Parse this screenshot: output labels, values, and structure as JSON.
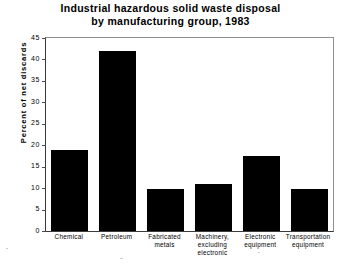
{
  "chart_data": {
    "type": "bar",
    "title": "Industrial hazardous solid waste disposal by manufacturing group, 1983",
    "title_lines": [
      "Industrial hazardous solid waste disposal",
      "by manufacturing group, 1983"
    ],
    "xlabel": "",
    "ylabel": "Percent of net discards",
    "ylim": [
      0,
      45
    ],
    "ytick_step": 5,
    "yticks": [
      0,
      5,
      10,
      15,
      20,
      25,
      30,
      35,
      40,
      45
    ],
    "ytick_labels": [
      "0",
      "5",
      "10",
      "15",
      "20",
      "25",
      "30",
      "35",
      "40",
      "45"
    ],
    "grid": false,
    "legend": "none",
    "bar_color": "#000000",
    "categories": [
      "Chemical",
      "Petroleum",
      "Fabricated metals",
      "Machinery, excluding electronic",
      "Electronic equipment",
      "Transportation equipment"
    ],
    "category_label_lines": [
      [
        "Chemical"
      ],
      [
        "Petroleum"
      ],
      [
        "Fabricated",
        "metals"
      ],
      [
        "Machinery,",
        "excluding",
        "electronic"
      ],
      [
        "Electronic",
        "equipment"
      ],
      [
        "Transportation",
        "equipment"
      ]
    ],
    "values": [
      19,
      42,
      9.8,
      11,
      17.5,
      9.8
    ]
  }
}
